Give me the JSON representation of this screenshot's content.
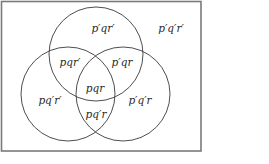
{
  "diagram": {
    "type": "venn",
    "sets": [
      "p",
      "q",
      "r"
    ],
    "colors": {
      "stroke": "#3a3a3a",
      "frame": "#7a7a7a",
      "text": "#2a2a2a",
      "background": "#ffffff"
    },
    "regions": {
      "top_only": "p′qr′",
      "outside": "p′q′r′",
      "top_left": "pqr′",
      "top_right": "p′qr",
      "center": "pqr",
      "left_only": "pq′r′",
      "right_only": "p′q′r",
      "bottom_left_right": "pq′r"
    }
  }
}
